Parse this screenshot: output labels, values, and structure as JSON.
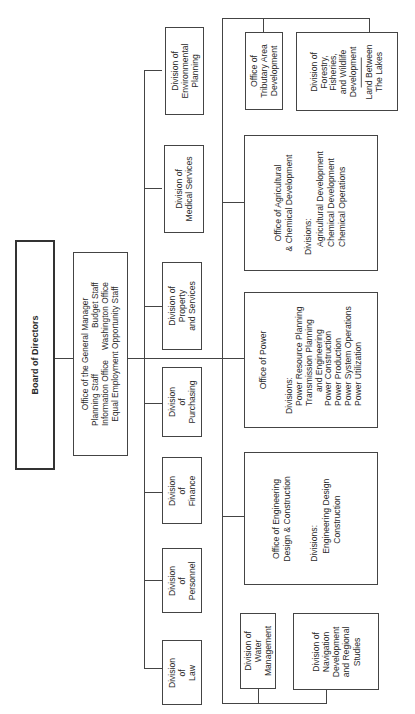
{
  "chart": {
    "orientation": "rotated 90 degrees counter-clockwise",
    "root": {
      "label": "Board of Directors"
    },
    "general_manager": {
      "title": "Office of the General Manager",
      "staff": [
        [
          "Planning Staff",
          "Budget Staff"
        ],
        [
          "Information Office",
          "Washington Office"
        ],
        [
          "Equal Employment Opportunity Staff"
        ]
      ]
    },
    "staff_divisions": [
      {
        "lines": [
          "Division",
          "of",
          "Law"
        ]
      },
      {
        "lines": [
          "Division",
          "of",
          "Personnel"
        ]
      },
      {
        "lines": [
          "Division",
          "of",
          "Finance"
        ]
      },
      {
        "lines": [
          "Division",
          "of",
          "Purchasing"
        ]
      },
      {
        "lines": [
          "Division of",
          "Property",
          "and Services"
        ]
      },
      {
        "lines": [
          "Division of",
          "Medical Services"
        ]
      },
      {
        "lines": [
          "Division of",
          "Environmental",
          "Planning"
        ]
      }
    ],
    "offices": {
      "water": {
        "lines": [
          "Division of",
          "Water",
          "Management"
        ]
      },
      "navigation": {
        "lines": [
          "Division of",
          "Navigation",
          "Development",
          "and Regional",
          "Studies"
        ]
      },
      "engineering": {
        "title": [
          "Office of Engineering",
          "Design & Construction"
        ],
        "divisions_label": "Divisions:",
        "divisions": [
          "Engineering Design",
          "Construction"
        ]
      },
      "power": {
        "title": [
          "Office of Power"
        ],
        "divisions_label": "Divisions:",
        "divisions": [
          "Power Resource Planning",
          "Transmission Planning",
          "  and Engineering",
          "Power Construction",
          "Power Production",
          "Power System Operations",
          "Power Utilization"
        ]
      },
      "agricultural": {
        "title": [
          "Office of Agricultural",
          "& Chemical Development"
        ],
        "divisions_label": "Divisions:",
        "divisions": [
          "Agricultural Development",
          "Chemical Development",
          "Chemical Operations"
        ]
      },
      "tributary": {
        "lines": [
          "Office of",
          "Tributary Area",
          "Development"
        ]
      },
      "forestry": {
        "lines": [
          "Division of",
          "Forestry,",
          "Fisheries,",
          "and Wildlife",
          "Development"
        ],
        "extra": [
          "Land Between",
          "The Lakes"
        ]
      }
    }
  }
}
